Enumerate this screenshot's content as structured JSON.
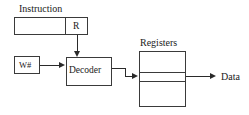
{
  "diagram": {
    "colors": {
      "background": "#ffffff",
      "stroke": "#3a3a3a",
      "connector": "#2a2a2a",
      "text": "#1a1a1a"
    },
    "nodes": {
      "instruction": {
        "title": "Instruction",
        "field_label": "R"
      },
      "write_number": {
        "label": "W#"
      },
      "decoder": {
        "label": "Decoder"
      },
      "registers": {
        "title": "Registers"
      },
      "data": {
        "label": "Data"
      }
    }
  }
}
